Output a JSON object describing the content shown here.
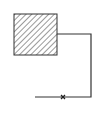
{
  "diagram": {
    "background": "#ffffff",
    "stroke_color": "#333333",
    "block": {
      "x": 14,
      "y": 14,
      "width": 43,
      "height": 41,
      "fill": "hatched"
    },
    "wire": {
      "points": "57,34 91,34 91,97 35,97"
    },
    "marker": {
      "type": "cross",
      "x": 63,
      "y": 97
    }
  }
}
